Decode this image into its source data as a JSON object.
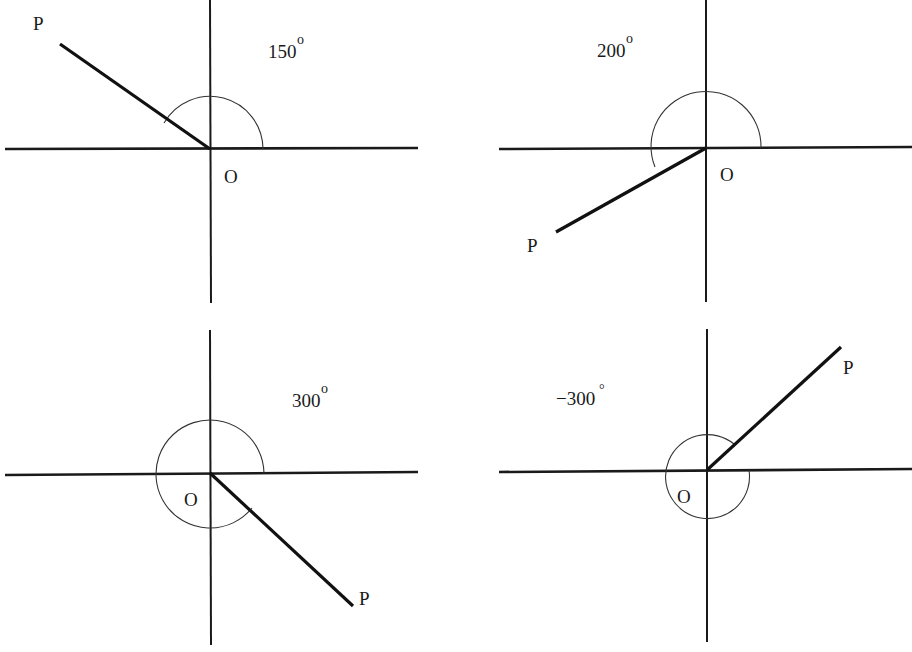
{
  "figure": {
    "panels": [
      {
        "id": "angle-150",
        "angle_label": "150",
        "degree_symbol": "o",
        "origin_label": "O",
        "point_label": "P",
        "angle_deg": 150,
        "origin": [
          210,
          149
        ],
        "point": [
          60,
          44
        ],
        "arc_radius": 53,
        "h_axis": [
          5,
          418
        ],
        "v_axis": [
          0,
          303
        ],
        "angle_label_pos": [
          268,
          58
        ],
        "origin_label_pos": [
          224,
          183
        ],
        "point_label_pos": [
          33,
          30
        ]
      },
      {
        "id": "angle-200",
        "angle_label": "200",
        "degree_symbol": "o",
        "origin_label": "O",
        "point_label": "P",
        "angle_deg": 200,
        "origin": [
          706,
          148
        ],
        "point": [
          556,
          232
        ],
        "arc_radius": 55,
        "h_axis": [
          499,
          912
        ],
        "v_axis": [
          0,
          302
        ],
        "angle_label_pos": [
          597,
          57
        ],
        "origin_label_pos": [
          720,
          181
        ],
        "point_label_pos": [
          527,
          252
        ]
      },
      {
        "id": "angle-300",
        "angle_label": "300",
        "degree_symbol": "o",
        "origin_label": "O",
        "point_label": "P",
        "angle_deg": 300,
        "origin": [
          210,
          473
        ],
        "point": [
          353,
          606
        ],
        "arc_radius": 54,
        "h_axis": [
          5,
          418
        ],
        "v_axis": [
          330,
          645
        ],
        "angle_label_pos": [
          292,
          407
        ],
        "origin_label_pos": [
          184,
          506
        ],
        "point_label_pos": [
          359,
          605
        ]
      },
      {
        "id": "angle-minus-300",
        "angle_label": "−300",
        "degree_symbol": "°",
        "origin_label": "O",
        "point_label": "P",
        "angle_deg": -300,
        "origin": [
          707,
          470
        ],
        "point": [
          841,
          347
        ],
        "arc_radius": 42,
        "h_axis": [
          499,
          912
        ],
        "v_axis": [
          329,
          642
        ],
        "angle_label_pos": [
          556,
          405
        ],
        "origin_label_pos": [
          677,
          503
        ],
        "point_label_pos": [
          843,
          374
        ]
      }
    ]
  }
}
